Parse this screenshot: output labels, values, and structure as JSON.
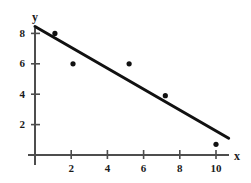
{
  "chart_data": {
    "type": "scatter",
    "title": "",
    "subtitle": "",
    "xlabel": "x",
    "ylabel": "y",
    "xlim": [
      0,
      11.2
    ],
    "ylim": [
      0,
      9.1
    ],
    "grid": false,
    "legend": null,
    "x_ticks": [
      2,
      4,
      6,
      8,
      10
    ],
    "y_ticks": [
      2,
      4,
      6,
      8
    ],
    "x_tick_labels": [
      "2",
      "4",
      "6",
      "8",
      "10"
    ],
    "y_tick_labels": [
      "2",
      "4",
      "6",
      "8"
    ],
    "series": [
      {
        "name": "data points",
        "type": "scatter",
        "marker": "filled-circle",
        "color": "#111111",
        "points": [
          {
            "x": 1.1,
            "y": 8.0
          },
          {
            "x": 2.1,
            "y": 6.0
          },
          {
            "x": 5.2,
            "y": 6.0
          },
          {
            "x": 7.2,
            "y": 3.9
          },
          {
            "x": 10.0,
            "y": 0.7
          }
        ]
      },
      {
        "name": "regression line",
        "type": "line",
        "color": "#111111",
        "points": [
          {
            "x": 0.0,
            "y": 8.45
          },
          {
            "x": 10.7,
            "y": 1.1
          }
        ]
      }
    ],
    "axis_color": "#4d4d4d",
    "ink_color": "#111111"
  },
  "labels": {
    "y_axis_title": "y",
    "x_axis_title": "x"
  },
  "geometry": {
    "origin_x": 35,
    "origin_y": 155,
    "x_unit_px": 18.1,
    "y_unit_px": 15.2,
    "x_axis_end_px": 229,
    "y_axis_top_px": 28
  }
}
